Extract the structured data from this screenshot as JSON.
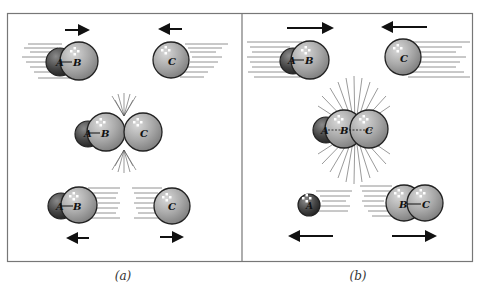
{
  "figure": {
    "panels": [
      {
        "id": "a",
        "caption": "(a)",
        "stages": [
          {
            "name": "approach",
            "left": "A-B",
            "right": "C"
          },
          {
            "name": "collision",
            "molecules": "A-B + C"
          },
          {
            "name": "rebound",
            "left": "A-B",
            "right": "C"
          }
        ]
      },
      {
        "id": "b",
        "caption": "(b)",
        "stages": [
          {
            "name": "approach",
            "left": "A-B",
            "right": "C"
          },
          {
            "name": "collision",
            "molecules": "A-B-C"
          },
          {
            "name": "products",
            "left": "A",
            "right": "B-C"
          }
        ]
      }
    ],
    "labels": {
      "A": "A",
      "B": "B",
      "C": "C"
    },
    "colors": {
      "atom_a": "#4a4a4a",
      "atom_bc": "#a8a8a8",
      "outline": "#222222",
      "frame": "#777777"
    }
  }
}
